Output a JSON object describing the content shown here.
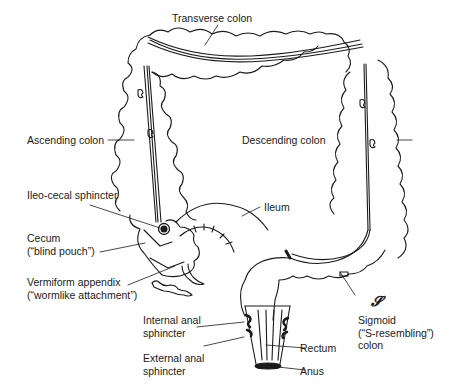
{
  "diagram": {
    "labels": {
      "transverse_colon": "Transverse colon",
      "ascending_colon": "Ascending colon",
      "descending_colon": "Descending colon",
      "ileocecal_sphincter": "Ileo-cecal sphincter",
      "ileum": "Ileum",
      "cecum_line1": "Cecum",
      "cecum_line2": "(“blind pouch”)",
      "appendix_line1": "Vermiform appendix",
      "appendix_line2": "(“wormlike attachment”)",
      "internal_anal_line1": "Internal anal",
      "internal_anal_line2": "sphincter",
      "external_anal_line1": "External anal",
      "external_anal_line2": "sphincter",
      "rectum": "Rectum",
      "anus": "Anus",
      "sigmoid_symbol": "𝓢",
      "sigmoid_line1": "Sigmoid",
      "sigmoid_line2": "(“S-resembling”)",
      "sigmoid_line3": "colon"
    },
    "colors": {
      "ink": "#1a1a1a",
      "background": "#ffffff"
    }
  }
}
